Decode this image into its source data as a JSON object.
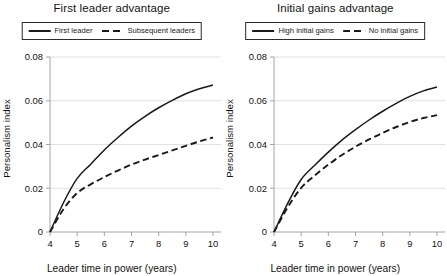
{
  "figure": {
    "width": 447,
    "height": 276,
    "background": "#ffffff",
    "line_color": "#1a1a1a",
    "grid_color": "#d9d9d9",
    "axis_color": "#9a9a9a"
  },
  "panels": [
    {
      "title": "First leader advantage",
      "legend": [
        {
          "label": "First leader",
          "style": "solid"
        },
        {
          "label": "Subsequent leaders",
          "style": "dashed"
        }
      ],
      "ylabel": "Personalism index",
      "xlabel": "Leader time in power (years)"
    },
    {
      "title": "Initial gains advantage",
      "legend": [
        {
          "label": "High initial gains",
          "style": "solid"
        },
        {
          "label": "No initial gains",
          "style": "dashed"
        }
      ],
      "ylabel": "Personalism index",
      "xlabel": "Leader time in power (years)"
    }
  ],
  "chart_data": [
    {
      "type": "line",
      "title": "First leader advantage",
      "xlabel": "Leader time in power (years)",
      "ylabel": "Personalism index",
      "xlim": [
        4,
        10
      ],
      "ylim": [
        0,
        0.08
      ],
      "xticks": [
        4,
        5,
        6,
        7,
        8,
        9,
        10
      ],
      "yticks": [
        0,
        0.02,
        0.04,
        0.06,
        0.08
      ],
      "ytick_labels": [
        "0",
        "0.02",
        "0.04",
        "0.06",
        "0.08"
      ],
      "grid": "horizontal",
      "legend_position": "top-center",
      "x": [
        4,
        4.5,
        5,
        5.5,
        6,
        6.5,
        7,
        7.5,
        8,
        8.5,
        9,
        9.5,
        10
      ],
      "series": [
        {
          "name": "First leader",
          "style": "solid",
          "values": [
            0,
            0.0135,
            0.0245,
            0.031,
            0.0375,
            0.0432,
            0.0484,
            0.0529,
            0.0568,
            0.0602,
            0.0632,
            0.0655,
            0.0672
          ]
        },
        {
          "name": "Subsequent leaders",
          "style": "dashed",
          "values": [
            0,
            0.0105,
            0.0178,
            0.0218,
            0.0251,
            0.0281,
            0.0308,
            0.0331,
            0.0352,
            0.0373,
            0.0394,
            0.0414,
            0.0432
          ]
        }
      ]
    },
    {
      "type": "line",
      "title": "Initial gains advantage",
      "xlabel": "Leader time in power (years)",
      "ylabel": "Personalism index",
      "xlim": [
        4,
        10
      ],
      "ylim": [
        0,
        0.08
      ],
      "xticks": [
        4,
        5,
        6,
        7,
        8,
        9,
        10
      ],
      "yticks": [
        0,
        0.02,
        0.04,
        0.06,
        0.08
      ],
      "ytick_labels": [
        "0",
        "0.02",
        "0.04",
        "0.06",
        "0.08"
      ],
      "grid": "horizontal",
      "legend_position": "top-center",
      "x": [
        4,
        4.5,
        5,
        5.5,
        6,
        6.5,
        7,
        7.5,
        8,
        8.5,
        9,
        9.5,
        10
      ],
      "series": [
        {
          "name": "High initial gains",
          "style": "solid",
          "values": [
            0,
            0.013,
            0.024,
            0.0305,
            0.0365,
            0.042,
            0.0468,
            0.0512,
            0.0552,
            0.0588,
            0.062,
            0.0645,
            0.0663
          ]
        },
        {
          "name": "No initial gains",
          "style": "dashed",
          "values": [
            0,
            0.0112,
            0.0202,
            0.0258,
            0.0308,
            0.0352,
            0.039,
            0.0423,
            0.0453,
            0.048,
            0.0503,
            0.0521,
            0.0534
          ]
        }
      ]
    }
  ]
}
